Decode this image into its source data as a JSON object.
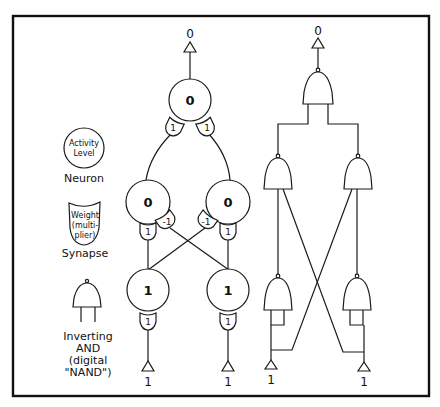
{
  "legend": {
    "neuron": {
      "inner_line1": "Activity",
      "inner_line2": "Level",
      "label": "Neuron"
    },
    "synapse": {
      "inner_line1": "Weight",
      "inner_line2": "(multi-",
      "inner_line3": "plier)",
      "label": "Synapse"
    },
    "gate": {
      "label_line1": "Inverting",
      "label_line2": "AND",
      "label_line3": "(digital",
      "label_line4": "\"NAND\")"
    }
  },
  "neural_network": {
    "output_label": "0",
    "top_neuron": {
      "activity": "0",
      "synapse_left": "1",
      "synapse_right": "1"
    },
    "middle_left_neuron": {
      "activity": "0",
      "synapse_straight": "1",
      "synapse_cross": "-1"
    },
    "middle_right_neuron": {
      "activity": "0",
      "synapse_straight": "1",
      "synapse_cross": "-1"
    },
    "bottom_left_neuron": {
      "activity": "1",
      "synapse": "1"
    },
    "bottom_right_neuron": {
      "activity": "1",
      "synapse": "1"
    },
    "input_left_label": "1",
    "input_right_label": "1"
  },
  "nand_network": {
    "output_label": "0",
    "input_left_label": "1",
    "input_right_label": "1",
    "gate_count": 5
  }
}
